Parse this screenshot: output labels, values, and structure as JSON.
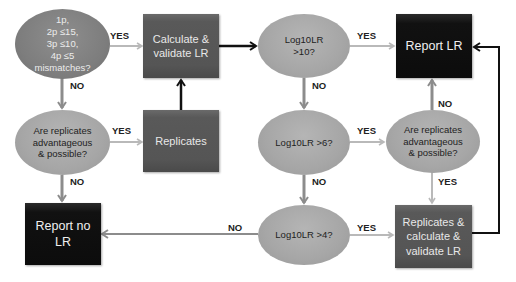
{
  "diagram": {
    "nodes": {
      "mismatch_check": {
        "shape": "ellipse",
        "lines": [
          "1p,",
          "2p ≤15,",
          "3p ≤10,",
          "4p ≤5",
          "mismatches?"
        ]
      },
      "calculate_validate": {
        "shape": "box",
        "lines": [
          "Calculate &",
          "validate LR"
        ]
      },
      "log10lr_gt10": {
        "shape": "ellipse",
        "lines": [
          "Log10LR",
          ">10?"
        ]
      },
      "report_lr": {
        "shape": "box",
        "lines": [
          "Report LR"
        ]
      },
      "replicates_q_left": {
        "shape": "ellipse",
        "lines": [
          "Are replicates",
          "advantageous",
          "& possible?"
        ]
      },
      "replicates": {
        "shape": "box",
        "lines": [
          "Replicates"
        ]
      },
      "log10lr_gt6": {
        "shape": "ellipse",
        "lines": [
          "Log10LR >6?"
        ]
      },
      "replicates_q_right": {
        "shape": "ellipse",
        "lines": [
          "Are replicates",
          "advantageous",
          "& possible?"
        ]
      },
      "report_no_lr": {
        "shape": "box",
        "lines": [
          "Report no",
          "LR"
        ]
      },
      "log10lr_gt4": {
        "shape": "ellipse",
        "lines": [
          "Log10LR >4?"
        ]
      },
      "replicates_calculate_validate": {
        "shape": "box",
        "lines": [
          "Replicates &",
          "calculate &",
          "validate LR"
        ]
      }
    },
    "edge_labels": {
      "mismatch_yes": "YES",
      "mismatch_no": "NO",
      "rep_left_yes": "YES",
      "rep_left_no": "NO",
      "gt10_yes": "YES",
      "gt10_no": "NO",
      "gt6_yes": "YES",
      "gt6_no": "NO",
      "rep_right_no": "NO",
      "rep_right_yes": "YES",
      "gt4_yes": "YES",
      "gt4_no": "NO"
    },
    "edges": [
      {
        "from": "mismatch_check",
        "to": "calculate_validate",
        "label": "YES"
      },
      {
        "from": "mismatch_check",
        "to": "replicates_q_left",
        "label": "NO"
      },
      {
        "from": "replicates_q_left",
        "to": "replicates",
        "label": "YES"
      },
      {
        "from": "replicates_q_left",
        "to": "report_no_lr",
        "label": "NO"
      },
      {
        "from": "replicates",
        "to": "calculate_validate",
        "label": ""
      },
      {
        "from": "calculate_validate",
        "to": "log10lr_gt10",
        "label": ""
      },
      {
        "from": "log10lr_gt10",
        "to": "report_lr",
        "label": "YES"
      },
      {
        "from": "log10lr_gt10",
        "to": "log10lr_gt6",
        "label": "NO"
      },
      {
        "from": "log10lr_gt6",
        "to": "replicates_q_right",
        "label": "YES"
      },
      {
        "from": "log10lr_gt6",
        "to": "log10lr_gt4",
        "label": "NO"
      },
      {
        "from": "replicates_q_right",
        "to": "report_lr",
        "label": "NO"
      },
      {
        "from": "replicates_q_right",
        "to": "replicates_calculate_validate",
        "label": "YES"
      },
      {
        "from": "log10lr_gt4",
        "to": "replicates_calculate_validate",
        "label": "YES"
      },
      {
        "from": "log10lr_gt4",
        "to": "report_no_lr",
        "label": "NO"
      },
      {
        "from": "replicates_calculate_validate",
        "to": "report_lr",
        "label": ""
      }
    ],
    "colors": {
      "ellipse_fill": "#a6a6a6",
      "ellipse_dark_fill": "#7d7d7d",
      "box_fill": "#555555",
      "box_black_fill": "#0c0c0c",
      "arrow_gray": "#8c8c8c",
      "arrow_light": "#b9b9b9",
      "arrow_black": "#111111"
    }
  }
}
